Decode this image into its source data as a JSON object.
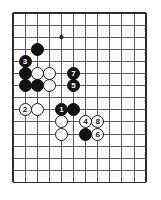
{
  "figure": {
    "kind": "go-board-diagram",
    "board": {
      "columns": 11,
      "rows": 14,
      "left": 13,
      "top": 13,
      "spacing": 12.1,
      "line_color": "#4a4a4a",
      "border_color": "#2b2b2b",
      "background_color": "#ffffff"
    },
    "star_points": [
      {
        "name": "star-point-1",
        "col": 4,
        "row": 2
      }
    ],
    "colors": {
      "black_stone": "#121212",
      "white_stone": "#ffffff",
      "black_label": "#ffffff",
      "white_label": "#111111"
    }
  },
  "stones": [
    {
      "name": "black-stone-a",
      "color": "black",
      "label": "",
      "col": 2,
      "row": 3
    },
    {
      "name": "black-stone-move-3",
      "color": "black",
      "label": "3",
      "col": 1,
      "row": 4
    },
    {
      "name": "black-stone-b",
      "color": "black",
      "label": "",
      "col": 1,
      "row": 5
    },
    {
      "name": "white-stone-a",
      "color": "white",
      "label": "",
      "col": 2,
      "row": 5
    },
    {
      "name": "white-stone-b",
      "color": "white",
      "label": "",
      "col": 3,
      "row": 5
    },
    {
      "name": "black-stone-move-7",
      "color": "black",
      "label": "7",
      "col": 5,
      "row": 5
    },
    {
      "name": "black-stone-c",
      "color": "black",
      "label": "",
      "col": 1,
      "row": 6
    },
    {
      "name": "black-stone-d",
      "color": "black",
      "label": "",
      "col": 2,
      "row": 6
    },
    {
      "name": "white-stone-c",
      "color": "white",
      "label": "",
      "col": 3,
      "row": 6
    },
    {
      "name": "black-stone-move-5",
      "color": "black",
      "label": "5",
      "col": 5,
      "row": 6
    },
    {
      "name": "white-stone-move-2",
      "color": "white",
      "label": "2",
      "col": 1,
      "row": 8
    },
    {
      "name": "white-stone-d",
      "color": "white",
      "label": "",
      "col": 2,
      "row": 8
    },
    {
      "name": "black-stone-move-1",
      "color": "black",
      "label": "1",
      "col": 4,
      "row": 8
    },
    {
      "name": "black-stone-e",
      "color": "black",
      "label": "",
      "col": 5,
      "row": 8
    },
    {
      "name": "white-stone-e",
      "color": "white",
      "label": "",
      "col": 4,
      "row": 9
    },
    {
      "name": "white-stone-move-4",
      "color": "white",
      "label": "4",
      "col": 6,
      "row": 9
    },
    {
      "name": "white-stone-move-8",
      "color": "white",
      "label": "8",
      "col": 7,
      "row": 9
    },
    {
      "name": "white-stone-f",
      "color": "white",
      "label": "",
      "col": 4,
      "row": 10
    },
    {
      "name": "black-stone-f",
      "color": "black",
      "label": "",
      "col": 6,
      "row": 10
    },
    {
      "name": "white-stone-move-6",
      "color": "white",
      "label": "6",
      "col": 7,
      "row": 10
    }
  ]
}
